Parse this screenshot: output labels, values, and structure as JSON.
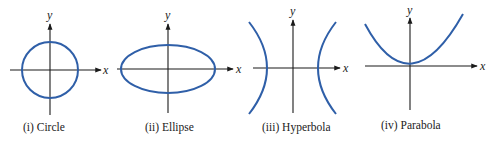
{
  "figure": {
    "panels": [
      {
        "id": "circle",
        "caption": "(i)  Circle",
        "x_label": "x",
        "y_label": "y",
        "curve_color": "#2f5fa8"
      },
      {
        "id": "ellipse",
        "caption": "(ii)  Ellipse",
        "x_label": "x",
        "y_label": "y",
        "curve_color": "#2f5fa8"
      },
      {
        "id": "hyperbola",
        "caption": "(iii)  Hyperbola",
        "x_label": "x",
        "y_label": "y",
        "curve_color": "#2f5fa8"
      },
      {
        "id": "parabola",
        "caption": "(iv)  Parabola",
        "x_label": "x",
        "y_label": "y",
        "curve_color": "#2f5fa8"
      }
    ]
  }
}
